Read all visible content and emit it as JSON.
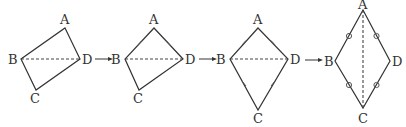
{
  "diagram": {
    "figures": [
      {
        "id": 1,
        "vertices": {
          "A": [
            65,
            28
          ],
          "B": [
            21,
            59
          ],
          "C": [
            36,
            90
          ],
          "D": [
            80,
            59
          ]
        },
        "labels": {
          "A": "A",
          "B": "B",
          "C": "C",
          "D": "D"
        },
        "dashed": [
          "B",
          "D"
        ],
        "marks": "none"
      },
      {
        "id": 2,
        "vertices": {
          "A": [
            154,
            28
          ],
          "B": [
            125,
            59
          ],
          "C": [
            139,
            90
          ],
          "D": [
            183,
            59
          ]
        },
        "labels": {
          "A": "A",
          "B": "B",
          "C": "C",
          "D": "D"
        },
        "dashed": [
          "B",
          "D"
        ],
        "marks": "AB and AD equal (tick marks)"
      },
      {
        "id": 3,
        "vertices": {
          "A": [
            258,
            28
          ],
          "B": [
            230,
            59
          ],
          "C": [
            258,
            110
          ],
          "D": [
            288,
            59
          ]
        },
        "labels": {
          "A": "A",
          "B": "B",
          "C": "C",
          "D": "D"
        },
        "dashed": [
          "B",
          "D"
        ],
        "marks": "AB=AD and CB=CD (tick marks)"
      },
      {
        "id": 4,
        "vertices": {
          "A": [
            363,
            8
          ],
          "B": [
            335,
            61
          ],
          "C": [
            363,
            108
          ],
          "D": [
            390,
            61
          ]
        },
        "labels": {
          "A": "A",
          "B": "B",
          "C": "C",
          "D": "D"
        },
        "dashed": [
          "A",
          "C"
        ],
        "marks": "all four sides equal (circle marks)"
      }
    ],
    "arrows": 3
  }
}
